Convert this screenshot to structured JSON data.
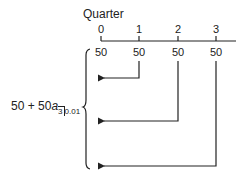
{
  "diagram": {
    "axis_title": "Quarter",
    "ticks": [
      {
        "label": "0",
        "x": 101
      },
      {
        "label": "1",
        "x": 139
      },
      {
        "label": "2",
        "x": 178
      },
      {
        "label": "3",
        "x": 216
      }
    ],
    "payments": [
      "50",
      "50",
      "50",
      "50"
    ],
    "formula": {
      "lead": "50 + 50",
      "symbol": "a",
      "term": "3",
      "rate": "0.01"
    },
    "line_color": "#222222"
  }
}
